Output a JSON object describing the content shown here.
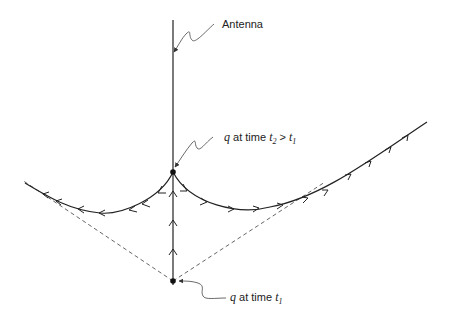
{
  "diagram": {
    "labels": {
      "antenna": "Antenna",
      "top_point": {
        "q": "q",
        "middle": " at time ",
        "t2": "t",
        "t2_sub": "2",
        "gt": " > ",
        "t1": "t",
        "t1_sub": "1"
      },
      "bottom_point": {
        "q": "q",
        "middle": " at time ",
        "t1": "t",
        "t1_sub": "1"
      }
    },
    "colors": {
      "line": "#222222",
      "dashed": "#555555",
      "leader": "#444444"
    }
  }
}
